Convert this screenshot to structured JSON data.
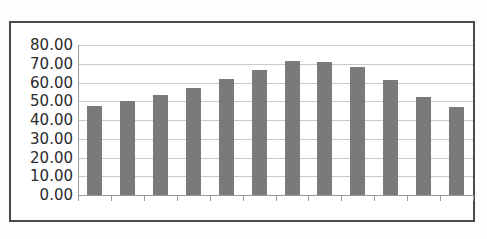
{
  "chart_data": {
    "type": "bar",
    "title": "",
    "subtitle": "",
    "xlabel": "",
    "ylabel": "",
    "categories": [
      "",
      "",
      "",
      "",
      "",
      "",
      "",
      "",
      "",
      "",
      "",
      ""
    ],
    "values": [
      47.3,
      50.4,
      53.2,
      57.1,
      62.0,
      66.8,
      71.6,
      71.1,
      68.2,
      61.3,
      52.2,
      46.9
    ],
    "series": [
      {
        "name": "",
        "values": [
          47.3,
          50.4,
          53.2,
          57.1,
          62.0,
          66.8,
          71.6,
          71.1,
          68.2,
          61.3,
          52.2,
          46.9
        ],
        "color": "#7a7a7a"
      }
    ],
    "ylim": [
      0.0,
      80.0
    ],
    "ytick_step": 10.0,
    "ytick_labels": [
      "0.00",
      "10.00",
      "20.00",
      "30.00",
      "40.00",
      "50.00",
      "60.00",
      "70.00",
      "80.00"
    ],
    "ytick_values": [
      0,
      10,
      20,
      30,
      40,
      50,
      60,
      70,
      80
    ],
    "xtick_labels": [],
    "grid": "horizontal",
    "legend": "none",
    "bar_count": 12
  },
  "style": {
    "bar_color": "#7a7a7a",
    "gridline_color": "#c9c9c9",
    "axis_color": "#9a9a9a",
    "frame_border_color": "#4a4a4a",
    "plot_background": "#ffffff",
    "page_background": "#fdfdfb",
    "tick_label_color": "#2b2b2b"
  }
}
